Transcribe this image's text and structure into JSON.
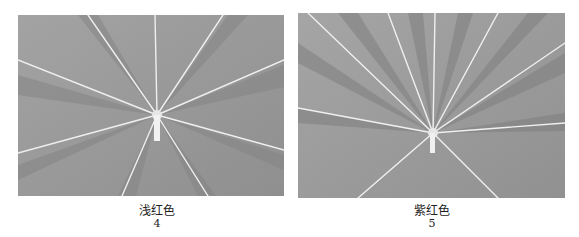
{
  "figures": [
    {
      "id": "left",
      "subject": "leaf-photo",
      "label": "浅红色",
      "number": "4"
    },
    {
      "id": "right",
      "subject": "leaf-photo",
      "label": "紫红色",
      "number": "5"
    }
  ],
  "colors": {
    "background": "#ffffff",
    "photo_base": "#9a9a9a",
    "vein": "#eeeeee",
    "text": "#222222"
  }
}
